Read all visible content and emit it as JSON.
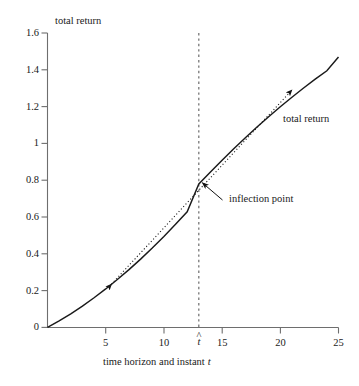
{
  "chart_data": {
    "type": "line",
    "title": "",
    "xlabel": "time horizon and instant t",
    "ylabel": "total return",
    "xlim": [
      0,
      25
    ],
    "ylim": [
      0,
      1.6
    ],
    "grid": false,
    "legend": "none",
    "xticks": [
      5,
      10,
      15,
      20,
      25
    ],
    "xticklabels": [
      "5",
      "10",
      "15",
      "20",
      "25"
    ],
    "yticks": [
      0,
      0.2,
      0.4,
      0.6,
      0.8,
      1,
      1.2,
      1.4,
      1.6
    ],
    "yticklabels": [
      "0",
      "0.2",
      "0.4",
      "0.6",
      "0.8",
      "1",
      "1.2",
      "1.4",
      "1.6"
    ],
    "special_xtick": {
      "label": "t",
      "accent": "^",
      "value": 13
    },
    "series": [
      {
        "name": "total return",
        "style": "solid",
        "color": "#1a1a1a",
        "x": [
          0,
          1,
          2,
          3,
          4,
          5,
          6,
          7,
          8,
          9,
          10,
          11,
          12,
          13,
          14,
          15,
          16,
          17,
          18,
          19,
          20,
          21,
          22,
          23,
          24,
          25
        ],
        "y": [
          0.0,
          0.035,
          0.074,
          0.116,
          0.161,
          0.209,
          0.26,
          0.314,
          0.371,
          0.431,
          0.494,
          0.56,
          0.628,
          0.78,
          0.845,
          0.909,
          0.971,
          1.031,
          1.089,
          1.145,
          1.199,
          1.251,
          1.301,
          1.349,
          1.395,
          1.47
        ]
      },
      {
        "name": "tangent at inflection point",
        "style": "dotted",
        "color": "#1a1a1a",
        "x": [
          5.5,
          21.0
        ],
        "y": [
          0.235,
          1.29
        ],
        "arrowheads": [
          "start",
          "end"
        ]
      }
    ],
    "vline": {
      "x": 13,
      "style": "dashed",
      "color": "#555555",
      "label": "t-hat"
    },
    "annotations": [
      {
        "text": "inflection point",
        "x": 13,
        "y": 0.78,
        "anchor": "point",
        "label_x": 16.0,
        "label_y": 0.72,
        "arrow": true
      },
      {
        "text": "total return",
        "x": 20.8,
        "y": 1.12,
        "anchor": "curve",
        "arrow": false
      }
    ],
    "inflection_point": {
      "x": 13,
      "y": 0.78
    }
  },
  "axes": {
    "y_title": "total return",
    "x_title_parts": {
      "text": "time horizon and instant",
      "symbol": "t"
    }
  },
  "labels": {
    "inflection_point": "inflection point",
    "total_return": "total return",
    "t_hat_base": "t",
    "t_hat_accent": "^"
  },
  "colors": {
    "curve": "#1a1a1a",
    "axis": "#6e6e6e",
    "dashed_vline": "#666666",
    "text": "#1a1a1a",
    "background": "#ffffff"
  }
}
